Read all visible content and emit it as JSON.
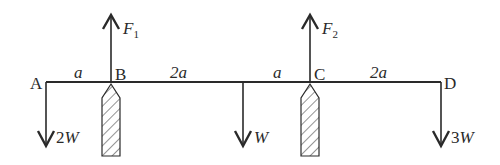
{
  "diagram": {
    "type": "beam-free-body",
    "colors": {
      "line": "#2a2a2a",
      "background": "#ffffff"
    },
    "points": [
      {
        "id": "A",
        "label": "A"
      },
      {
        "id": "B",
        "label": "B"
      },
      {
        "id": "C",
        "label": "C"
      },
      {
        "id": "D",
        "label": "D"
      }
    ],
    "spans": [
      {
        "from": "A",
        "to": "B",
        "label": "a"
      },
      {
        "from": "B",
        "to": "W",
        "label": "2a"
      },
      {
        "from": "W",
        "to": "C",
        "label": "a"
      },
      {
        "from": "C",
        "to": "D",
        "label": "2a"
      }
    ],
    "up_forces": [
      {
        "at": "B",
        "symbol": "F",
        "subscript": "1"
      },
      {
        "at": "C",
        "symbol": "F",
        "subscript": "2"
      }
    ],
    "down_loads": [
      {
        "at": "A",
        "coef": "2",
        "symbol": "W"
      },
      {
        "at": "mid",
        "coef": "",
        "symbol": "W"
      },
      {
        "at": "D",
        "coef": "3",
        "symbol": "W"
      }
    ],
    "supports": [
      {
        "at": "B",
        "kind": "knife-edge"
      },
      {
        "at": "C",
        "kind": "knife-edge"
      }
    ]
  }
}
